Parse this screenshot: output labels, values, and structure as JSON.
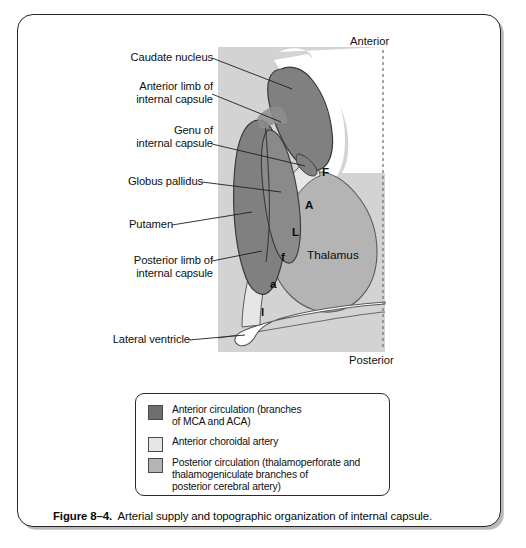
{
  "figure": {
    "caption_label": "Figure 8–4.",
    "caption_text": "Arterial supply and topographic organization of internal capsule."
  },
  "orientation": {
    "anterior": "Anterior",
    "posterior": "Posterior"
  },
  "structure_labels": [
    {
      "id": "caudate-nucleus",
      "text": "Caudate nucleus"
    },
    {
      "id": "anterior-limb",
      "text": "Anterior limb of\ninternal capsule"
    },
    {
      "id": "genu",
      "text": "Genu of\ninternal capsule"
    },
    {
      "id": "globus-pallidus",
      "text": "Globus pallidus"
    },
    {
      "id": "putamen",
      "text": "Putamen"
    },
    {
      "id": "posterior-limb",
      "text": "Posterior limb of\ninternal capsule"
    },
    {
      "id": "lateral-ventricle",
      "text": "Lateral ventricle"
    }
  ],
  "inline_labels": {
    "thalamus": "Thalamus",
    "somatotopic": [
      {
        "id": "face-genu",
        "text": "F"
      },
      {
        "id": "arm",
        "text": "A"
      },
      {
        "id": "leg",
        "text": "L"
      },
      {
        "id": "face-lower",
        "text": "f"
      },
      {
        "id": "arm-lower",
        "text": "a"
      },
      {
        "id": "leg-lower",
        "text": "l"
      }
    ]
  },
  "legend": {
    "items": [
      {
        "id": "anterior-circulation",
        "color": "#6e6e6e",
        "text": "Anterior circulation (branches\nof MCA and ACA)"
      },
      {
        "id": "anterior-choroidal-artery",
        "color": "#e6e6e6",
        "text": "Anterior choroidal artery"
      },
      {
        "id": "posterior-circulation",
        "color": "#b4b4b4",
        "text": "Posterior circulation (thalamoperforate and\nthalamogeniculate branches of\nposterior cerebral artery)"
      }
    ]
  },
  "colors": {
    "panel_background": "#d3d3d3",
    "dark_gray": "#808080",
    "medium_gray": "#b4b4b4",
    "light_gray": "#e6e6e6",
    "white": "#ffffff",
    "outline": "#3a3a3a",
    "frame": "#262626"
  }
}
